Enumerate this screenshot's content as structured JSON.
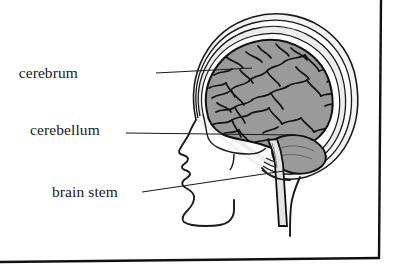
{
  "figure": {
    "type": "anatomical-line-diagram",
    "background_color": "#ffffff",
    "ink_color": "#1a1a1a",
    "brain_fill_color": "#9a9a9a",
    "brain_sulci_color": "#111111",
    "skull_fill_color": "#ededed",
    "border": {
      "right_line": true,
      "bottom_line": true,
      "color": "#111111"
    }
  },
  "labels": [
    {
      "id": "cerebrum",
      "text": "cerebrum",
      "text_x": 78,
      "text_y": 78,
      "leader_from_x": 156,
      "leader_from_y": 73,
      "leader_to_x": 252,
      "leader_to_y": 68
    },
    {
      "id": "cerebellum",
      "text": "cerebellum",
      "text_x": 30,
      "text_y": 135,
      "leader_from_x": 126,
      "leader_from_y": 133,
      "leader_to_x": 296,
      "leader_to_y": 135
    },
    {
      "id": "brain-stem",
      "text": "brain stem",
      "text_x": 52,
      "text_y": 197,
      "leader_from_x": 142,
      "leader_from_y": 192,
      "leader_to_x": 284,
      "leader_to_y": 171
    }
  ]
}
